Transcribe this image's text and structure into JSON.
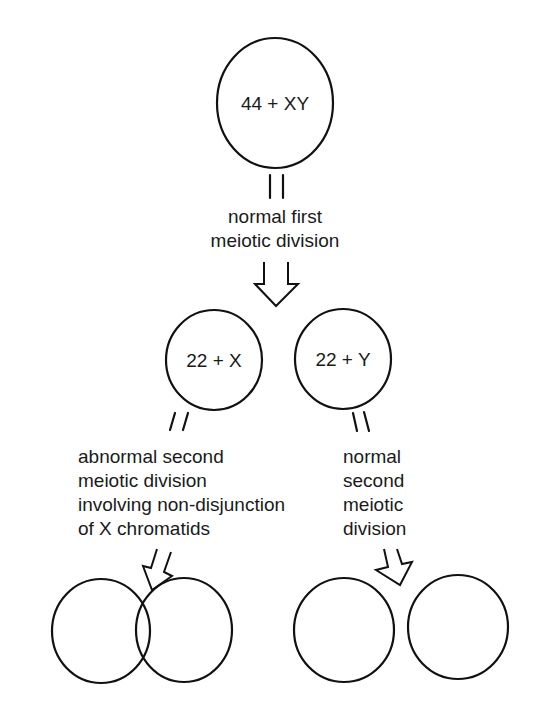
{
  "diagram": {
    "colors": {
      "stroke": "#111111",
      "text": "#1a1a1a",
      "background": "#ffffff"
    },
    "cells": {
      "parent": {
        "label": "44 + XY",
        "cx": 275,
        "cy": 103,
        "rx": 58,
        "ry": 65
      },
      "secondary_x": {
        "label": "22 + X",
        "cx": 214,
        "cy": 360,
        "rx": 48,
        "ry": 50
      },
      "secondary_y": {
        "label": "22 + Y",
        "cx": 343,
        "cy": 359,
        "rx": 48,
        "ry": 50
      },
      "gamete_1": {
        "label": "",
        "cx": 101,
        "cy": 631,
        "rx": 49,
        "ry": 52
      },
      "gamete_2": {
        "label": "",
        "cx": 184,
        "cy": 630,
        "rx": 48,
        "ry": 52
      },
      "gamete_3": {
        "label": "",
        "cx": 344,
        "cy": 630,
        "rx": 50,
        "ry": 52
      },
      "gamete_4": {
        "label": "",
        "cx": 458,
        "cy": 627,
        "rx": 50,
        "ry": 52
      }
    },
    "captions": {
      "first_division": {
        "lines": [
          "normal first",
          "meiotic division"
        ]
      },
      "abnormal_second": {
        "lines": [
          "abnormal second",
          "meiotic division",
          "involving non-disjunction",
          "of X chromatids"
        ]
      },
      "normal_second": {
        "lines": [
          "normal",
          "second",
          "meiotic",
          "division"
        ]
      }
    },
    "arrows": [
      {
        "name": "arrow-first-division",
        "direction": "down"
      },
      {
        "name": "arrow-abnormal-second",
        "direction": "down-left"
      },
      {
        "name": "arrow-normal-second",
        "direction": "down-right"
      }
    ]
  }
}
